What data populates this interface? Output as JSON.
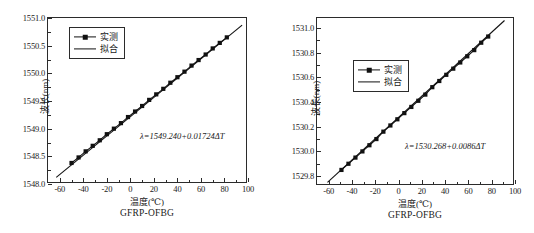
{
  "figure": {
    "background": "#ffffff",
    "line_color": "#111111",
    "marker_color": "#111111",
    "axis_color": "#2b2b2b"
  },
  "chart_data": [
    {
      "type": "line",
      "panel": "left",
      "title": "",
      "caption": "GFRP-OFBG",
      "xlabel": "温度(℃)",
      "ylabel": "波长(nm)",
      "xlim": [
        -70,
        100
      ],
      "ylim": [
        1548.0,
        1551.0
      ],
      "xticks": [
        -60,
        -40,
        -20,
        0,
        20,
        40,
        60,
        80,
        100
      ],
      "xtick_labels": [
        "-60",
        "-40",
        "-20",
        "0",
        "20",
        "40",
        "60",
        "80",
        "100"
      ],
      "yticks": [
        1548.0,
        1548.5,
        1549.0,
        1549.5,
        1550.0,
        1550.5,
        1551.0
      ],
      "ytick_labels": [
        "1548.0",
        "1548.5",
        "1549.0",
        "1549.5",
        "1550.0",
        "1550.5",
        "1551.0"
      ],
      "grid": false,
      "legend_position": "upper left",
      "annotation": "λ=1549.240+0.01724ΔT",
      "series": [
        {
          "name": "实测",
          "style": "line-marker",
          "marker": "square",
          "x": [
            -50,
            -44,
            -38,
            -32,
            -26,
            -20,
            -14,
            -8,
            -2,
            4,
            10,
            16,
            22,
            28,
            34,
            40,
            46,
            52,
            58,
            64,
            70,
            76,
            82
          ],
          "y": [
            1548.38,
            1548.48,
            1548.59,
            1548.69,
            1548.79,
            1548.9,
            1549.0,
            1549.1,
            1549.21,
            1549.31,
            1549.41,
            1549.52,
            1549.62,
            1549.72,
            1549.83,
            1549.93,
            1550.03,
            1550.14,
            1550.24,
            1550.34,
            1550.45,
            1550.55,
            1550.65
          ]
        },
        {
          "name": "拟合",
          "style": "line",
          "x": [
            -63,
            95
          ],
          "y": [
            1548.12,
            1550.87
          ]
        }
      ]
    },
    {
      "type": "line",
      "panel": "right",
      "title": "",
      "caption": "GFRP-OFBG",
      "xlabel": "温度(℃)",
      "ylabel": "波长(nm)",
      "xlim": [
        -70,
        100
      ],
      "ylim": [
        1529.72,
        1531.08
      ],
      "xticks": [
        -60,
        -40,
        -20,
        0,
        20,
        40,
        60,
        80,
        100
      ],
      "xtick_labels": [
        "-60",
        "-40",
        "-20",
        "0",
        "20",
        "40",
        "60",
        "80",
        "100"
      ],
      "yticks": [
        1529.8,
        1530.0,
        1530.2,
        1530.4,
        1530.6,
        1530.8,
        1531.0
      ],
      "ytick_labels": [
        "1529.8",
        "1530.0",
        "1530.2",
        "1530.4",
        "1530.6",
        "1530.8",
        "1531.0"
      ],
      "grid": false,
      "legend_position": "upper center",
      "annotation": "λ=1530.268+0.0086ΔT",
      "series": [
        {
          "name": "实测",
          "style": "line-marker",
          "marker": "square",
          "x": [
            -49,
            -43,
            -37,
            -31,
            -25,
            -19,
            -13,
            -7,
            -1,
            5,
            11,
            17,
            23,
            29,
            35,
            41,
            47,
            53,
            59,
            65,
            71,
            77
          ],
          "y": [
            1529.85,
            1529.9,
            1529.95,
            1530.0,
            1530.05,
            1530.1,
            1530.16,
            1530.21,
            1530.26,
            1530.31,
            1530.36,
            1530.41,
            1530.46,
            1530.52,
            1530.57,
            1530.62,
            1530.67,
            1530.72,
            1530.77,
            1530.82,
            1530.88,
            1530.93
          ]
        },
        {
          "name": "拟合",
          "style": "line",
          "x": [
            -61,
            91
          ],
          "y": [
            1529.75,
            1531.06
          ]
        }
      ]
    }
  ]
}
